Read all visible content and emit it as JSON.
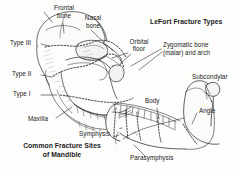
{
  "figure": {
    "title_lefort": "LeFort Fracture Types",
    "title_mandible_line1": "Common Fracture Sites",
    "title_mandible_line2": "of Mandible",
    "labels": {
      "frontal_bone_l1": "Frontal",
      "frontal_bone_l2": "bone",
      "nasal_bone_l1": "Nasal",
      "nasal_bone_l2": "bone",
      "orbital_floor_l1": "Orbital",
      "orbital_floor_l2": "floor",
      "zygomatic_l1": "Zygomatic bone",
      "zygomatic_l2": "(malar) and arch",
      "subcondylar": "Subcondylar",
      "type_iii": "Type III",
      "type_ii": "Type II",
      "type_i": "Type I",
      "maxilla": "Maxilla",
      "symphysis": "Symphysis",
      "parasymphysis": "Parasymphysis",
      "body": "Body",
      "angle": "Angle"
    },
    "colors": {
      "ink": "#1a1a1a",
      "line": "#2b2b2b",
      "shade": "#b9b9b4",
      "background": "#fdfdfc"
    }
  }
}
